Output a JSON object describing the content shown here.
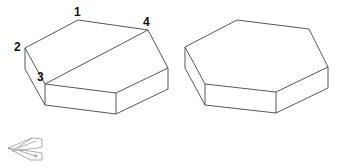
{
  "figure": {
    "left_prism": {
      "labels": [
        {
          "id": "v1",
          "text": "1"
        },
        {
          "id": "v2",
          "text": "2"
        },
        {
          "id": "v3",
          "text": "3"
        },
        {
          "id": "v4",
          "text": "4"
        }
      ],
      "diagonal": "3-4"
    },
    "right_prism": {
      "labels": []
    },
    "small_icon": "view-orientation-icon"
  }
}
